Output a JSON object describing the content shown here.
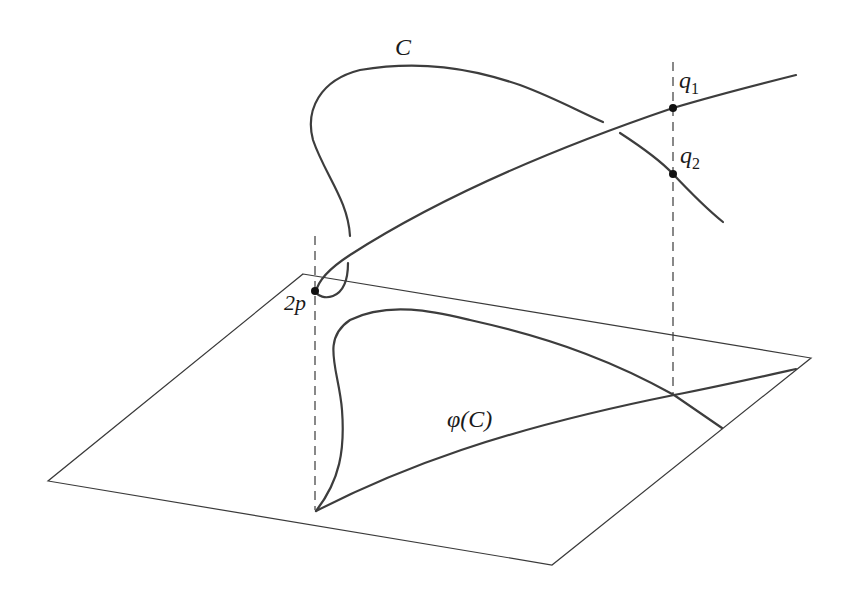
{
  "figure": {
    "labels": {
      "curve": "C",
      "projection": "φ(C)",
      "point_2p": "2p",
      "q1_base": "q",
      "q1_sub": "1",
      "q2_base": "q",
      "q2_sub": "2"
    },
    "colors": {
      "stroke": "#3d3d3d",
      "background": "#ffffff"
    }
  }
}
